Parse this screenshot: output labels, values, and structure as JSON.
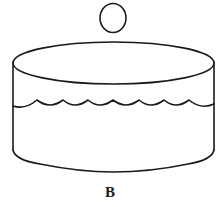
{
  "figure": {
    "label": "B",
    "elements": [
      {
        "name": "ball",
        "type": "circle",
        "description": "small sphere above the container"
      },
      {
        "name": "container",
        "type": "cylinder",
        "description": "open cylindrical container"
      },
      {
        "name": "water-surface",
        "type": "wavy-line",
        "description": "liquid surface with scalloped waves",
        "wave_count": 8
      }
    ],
    "colors": {
      "line": "#1a1a1a",
      "background": "#ffffff"
    }
  }
}
